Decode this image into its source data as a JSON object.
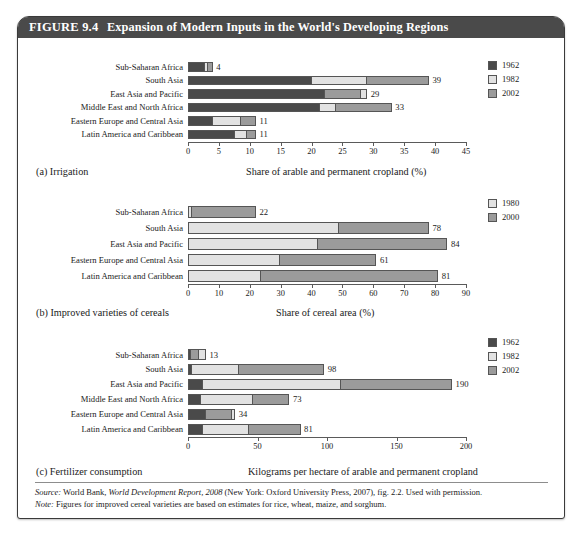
{
  "figure": {
    "number": "FIGURE 9.4",
    "title": "Expansion of Modern Inputs in the World's Developing Regions"
  },
  "colors": {
    "title_bar": "#4a4a4a",
    "series_dark": "#4a4a4a",
    "series_light": "#e2e2e2",
    "series_mid": "#9b9b9b",
    "axis": "#5a5a5a",
    "page_background": "#ffffff"
  },
  "footer": {
    "source_label": "Source:",
    "source_text_1": " World Bank, ",
    "source_italic": "World Development Report, 2008",
    "source_text_2": " (New York: Oxford University Press, 2007), fig. 2.2. Used with permission.",
    "note_label": "Note:",
    "note_text": " Figures for improved cereal varieties are based on estimates for rice, wheat, maize, and sorghum."
  },
  "chart_data": [
    {
      "id": "a",
      "type": "bar",
      "orientation": "horizontal",
      "panel_tag": "(a) Irrigation",
      "title": "Irrigation",
      "xlabel": "Share of arable and permanent cropland (%)",
      "ylabel": "",
      "xlim": [
        0,
        45
      ],
      "xticks": [
        0,
        5,
        10,
        15,
        20,
        25,
        30,
        35,
        40,
        45
      ],
      "grid": false,
      "legend_position": "top-right",
      "legend": [
        "1962",
        "1982",
        "2002"
      ],
      "categories": [
        "Sub-Saharan Africa",
        "South Asia",
        "East Asia and Pacific",
        "Middle East and North Africa",
        "Eastern Europe and Central Asia",
        "Latin America and Caribbean"
      ],
      "series": [
        {
          "name": "1962",
          "values": [
            2.8,
            20.0,
            22.2,
            21.4,
            4.1,
            7.6
          ]
        },
        {
          "name": "1982",
          "values": [
            3.3,
            29.0,
            29.0,
            23.9,
            8.6,
            9.6
          ]
        },
        {
          "name": "2002",
          "values": [
            4,
            39,
            28.0,
            33,
            11,
            11
          ]
        }
      ],
      "data_labels": [
        "4",
        "39",
        "29",
        "33",
        "11",
        "11"
      ]
    },
    {
      "id": "b",
      "type": "bar",
      "orientation": "horizontal",
      "panel_tag": "(b) Improved varieties of cereals",
      "title": "Improved varieties of cereals",
      "xlabel": "Share of cereal area (%)",
      "ylabel": "",
      "xlim": [
        0,
        90
      ],
      "xticks": [
        0,
        10,
        20,
        30,
        40,
        50,
        60,
        70,
        80,
        90
      ],
      "grid": false,
      "legend_position": "top-right",
      "legend": [
        "1980",
        "2000"
      ],
      "categories": [
        "Sub-Saharan Africa",
        "South Asia",
        "East Asia and Pacific",
        "Eastern Europe and Central Asia",
        "Latin America and Caribbean"
      ],
      "series": [
        {
          "name": "1980",
          "values": [
            1.2,
            49.0,
            42.0,
            29.8,
            23.6
          ]
        },
        {
          "name": "2000",
          "values": [
            22,
            78,
            84,
            61,
            81
          ]
        }
      ],
      "data_labels": [
        "22",
        "78",
        "84",
        "61",
        "81"
      ]
    },
    {
      "id": "c",
      "type": "bar",
      "orientation": "horizontal",
      "panel_tag": "(c) Fertilizer consumption",
      "title": "Fertilizer consumption",
      "xlabel": "Kilograms per hectare of arable and permanent cropland",
      "ylabel": "",
      "xlim": [
        0,
        200
      ],
      "xticks": [
        0,
        50,
        100,
        150,
        200
      ],
      "grid": false,
      "legend_position": "top-right",
      "legend": [
        "1962",
        "1982",
        "2002"
      ],
      "categories": [
        "Sub-Saharan Africa",
        "South Asia",
        "East Asia and Pacific",
        "Middle East and North Africa",
        "Eastern Europe and Central Asia",
        "Latin America and Caribbean"
      ],
      "series": [
        {
          "name": "1962",
          "values": [
            2.5,
            3.0,
            10.5,
            9.5,
            13.0,
            10.5
          ]
        },
        {
          "name": "1982",
          "values": [
            13,
            37.0,
            110.0,
            47.0,
            34,
            44.0
          ]
        },
        {
          "name": "2002",
          "values": [
            8.0,
            98,
            190,
            73,
            32.0,
            81
          ]
        }
      ],
      "data_labels": [
        "13",
        "98",
        "190",
        "73",
        "34",
        "81"
      ]
    }
  ]
}
